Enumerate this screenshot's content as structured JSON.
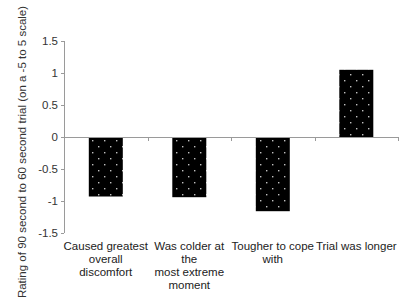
{
  "chart_data": {
    "type": "bar",
    "title": "",
    "xlabel": "",
    "ylabel": "Rating of 90 second to 60 second trial (on a -5 to 5 scale)",
    "categories": [
      "Caused greatest overall discomfort",
      "Was colder at the most extreme moment",
      "Tougher to cope with",
      "Trial was longer"
    ],
    "category_lines": [
      [
        "Caused greatest",
        "overall",
        "discomfort"
      ],
      [
        "Was colder at the",
        "most extreme",
        "moment"
      ],
      [
        "Tougher to cope",
        "with"
      ],
      [
        "Trial was longer"
      ]
    ],
    "values": [
      -0.93,
      -0.94,
      -1.16,
      1.05
    ],
    "ylim": [
      -1.5,
      1.5
    ],
    "yticks": [
      "1.5",
      "1",
      "0.5",
      "0",
      "-0.5",
      "-1",
      "-1.5"
    ],
    "ytick_values": [
      1.5,
      1,
      0.5,
      0,
      -0.5,
      -1,
      -1.5
    ],
    "grid": false,
    "legend": null,
    "bar_fill": "#000000",
    "bar_pattern": "white dots",
    "axis_color": "#9a9a9a"
  }
}
